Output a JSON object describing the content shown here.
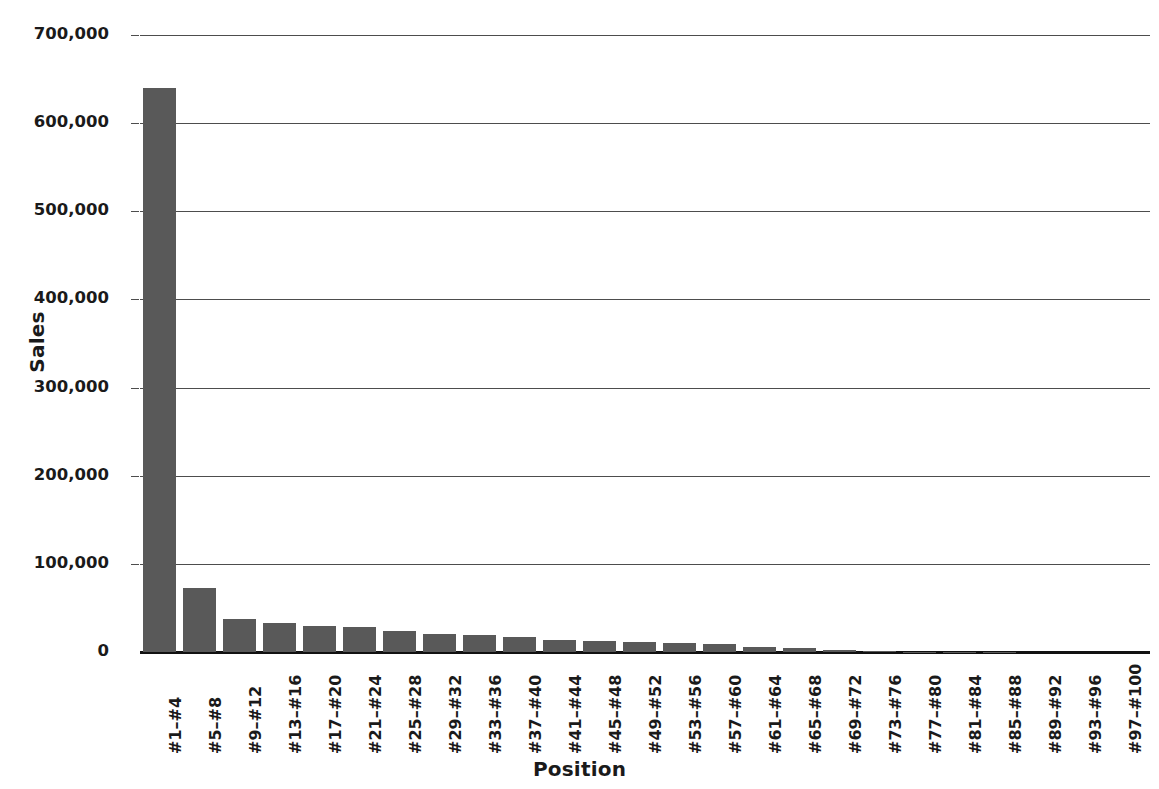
{
  "chart_data": {
    "type": "bar",
    "title": "",
    "xlabel": "Position",
    "ylabel": "Sales",
    "categories": [
      "#1–#4",
      "#5–#8",
      "#9–#12",
      "#13–#16",
      "#17–#20",
      "#21–#24",
      "#25–#28",
      "#29–#32",
      "#33–#36",
      "#37–#40",
      "#41–#44",
      "#45–#48",
      "#49–#52",
      "#53–#56",
      "#57–#60",
      "#61–#64",
      "#65–#68",
      "#69–#72",
      "#73–#76",
      "#77–#80",
      "#81–#84",
      "#85–#88",
      "#89–#92",
      "#93–#96",
      "#97–#100"
    ],
    "values": [
      640000,
      73000,
      37000,
      33000,
      30000,
      28000,
      24000,
      21000,
      19000,
      17000,
      14000,
      12000,
      11000,
      10000,
      9000,
      6000,
      4500,
      2000,
      1000,
      400,
      200,
      100,
      80,
      50,
      30
    ],
    "ylim": [
      0,
      700000
    ],
    "ytick_labels": [
      "700,000",
      "600,000",
      "500,000",
      "400,000",
      "300,000",
      "200,000",
      "100,000",
      "0"
    ],
    "ytick_values": [
      700000,
      600000,
      500000,
      400000,
      300000,
      200000,
      100000,
      0
    ],
    "grid": true,
    "legend": false,
    "bar_color": "#595959",
    "gridline_color": "#4d4d4d",
    "axis_color": "#111111",
    "background_color": "#ffffff"
  }
}
